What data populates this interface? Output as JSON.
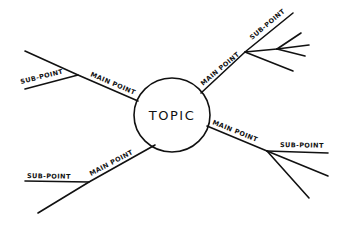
{
  "diagram": {
    "type": "mind-map",
    "style": "hand-drawn",
    "colors": {
      "ink": "#111111",
      "background": "#ffffff"
    },
    "center": {
      "label": "TOPIC"
    },
    "branches": [
      {
        "id": "upper-left",
        "main_label": "MAIN POINT",
        "sub_label": "SUB-POINT"
      },
      {
        "id": "upper-right",
        "main_label": "MAIN POINT",
        "sub_label": "SUB-POINT"
      },
      {
        "id": "right",
        "main_label": "MAIN POINT",
        "sub_label": "SUB-POINT"
      },
      {
        "id": "lower-left",
        "main_label": "MAIN POINT",
        "sub_label": "SUB-POINT"
      }
    ]
  }
}
